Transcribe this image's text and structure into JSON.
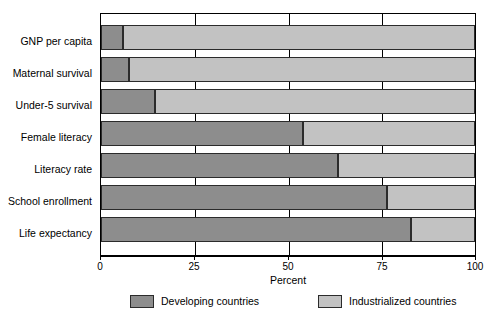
{
  "chart_data": {
    "type": "bar",
    "orientation": "horizontal",
    "stacked": true,
    "title": "",
    "xlabel": "Percent",
    "ylabel": "",
    "xlim": [
      0,
      100
    ],
    "xticks": [
      "0",
      "25",
      "50",
      "75",
      "100"
    ],
    "xtick_values": [
      0,
      25,
      50,
      75,
      100
    ],
    "grid": true,
    "legend_position": "bottom",
    "categories": [
      "GNP per capita",
      "Maternal survival",
      "Under-5 survival",
      "Female literacy",
      "Literacy rate",
      "School enrollment",
      "Life expectancy"
    ],
    "series": [
      {
        "name": "Developing countries",
        "color": "#8d8d8d",
        "values": [
          6,
          7.5,
          14.5,
          54,
          63.5,
          76.5,
          83
        ]
      },
      {
        "name": "Industrialized countries",
        "color": "#c2c2c2",
        "values": [
          94,
          92.5,
          85.5,
          46,
          36.5,
          23.5,
          17
        ]
      }
    ]
  },
  "legend": {
    "items": [
      {
        "label": "Developing countries",
        "swatch": "dev"
      },
      {
        "label": "Industrialized countries",
        "swatch": "ind"
      }
    ]
  }
}
